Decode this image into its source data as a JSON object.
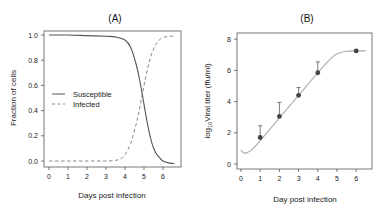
{
  "chart_data": [
    {
      "type": "line",
      "title": "(A)",
      "xlabel": "Days post infection",
      "ylabel": "Fraction of cells",
      "xlim": [
        -0.2,
        6.8
      ],
      "ylim": [
        -0.05,
        1.05
      ],
      "xticks": [
        0,
        1,
        2,
        3,
        4,
        5,
        6
      ],
      "yticks": [
        "0.0",
        "0.2",
        "0.4",
        "0.6",
        "0.8",
        "1.0"
      ],
      "grid": false,
      "legend_position": "center-left",
      "series": [
        {
          "name": "Susceptible",
          "style": "solid",
          "color": "#555555",
          "x": [
            0,
            1,
            2,
            3,
            3.5,
            4,
            4.3,
            4.6,
            4.8,
            5.0,
            5.2,
            5.4,
            5.6,
            5.8,
            6.0,
            6.3,
            6.6
          ],
          "y": [
            1.0,
            1.0,
            0.995,
            0.99,
            0.985,
            0.96,
            0.9,
            0.76,
            0.62,
            0.45,
            0.28,
            0.15,
            0.07,
            0.03,
            0.0,
            -0.015,
            -0.02
          ]
        },
        {
          "name": "Infected",
          "style": "dashed",
          "color": "#888888",
          "x": [
            0,
            1,
            2,
            3,
            3.5,
            3.8,
            4.0,
            4.3,
            4.6,
            4.8,
            5.0,
            5.2,
            5.4,
            5.6,
            5.8,
            6.0,
            6.3,
            6.6
          ],
          "y": [
            0.0,
            0.0,
            0.0,
            0.0,
            0.005,
            0.02,
            0.05,
            0.14,
            0.3,
            0.44,
            0.6,
            0.74,
            0.85,
            0.92,
            0.96,
            0.98,
            0.99,
            0.99
          ]
        }
      ]
    },
    {
      "type": "scatter",
      "title": "(B)",
      "xlabel": "Day post infection",
      "ylabel_prefix": "log",
      "ylabel_sub": "10",
      "ylabel_rest": "Viral titer (ffu/ml)",
      "xlim": [
        -0.2,
        6.8
      ],
      "ylim": [
        -0.4,
        8.3
      ],
      "xticks": [
        0,
        1,
        2,
        3,
        4,
        5,
        6
      ],
      "yticks": [
        0,
        2,
        4,
        6,
        8
      ],
      "grid": false,
      "series": [
        {
          "name": "Observed",
          "style": "points-with-error",
          "color": "#444444",
          "x": [
            1,
            2,
            3,
            4,
            6
          ],
          "y": [
            1.7,
            3.05,
            4.4,
            5.85,
            7.25
          ],
          "error_upper": [
            2.45,
            3.95,
            4.9,
            6.55,
            7.25
          ]
        },
        {
          "name": "Model fit",
          "style": "solid",
          "color": "#aaaaaa",
          "x": [
            0.0,
            0.1,
            0.2,
            0.35,
            0.6,
            1.0,
            2.0,
            3.0,
            4.0,
            4.8,
            5.2,
            5.5,
            5.8,
            6.1,
            6.5
          ],
          "y": [
            0.9,
            0.75,
            0.7,
            0.75,
            0.95,
            1.5,
            2.95,
            4.4,
            5.85,
            6.9,
            7.15,
            7.22,
            7.25,
            7.25,
            7.25
          ]
        }
      ]
    }
  ]
}
